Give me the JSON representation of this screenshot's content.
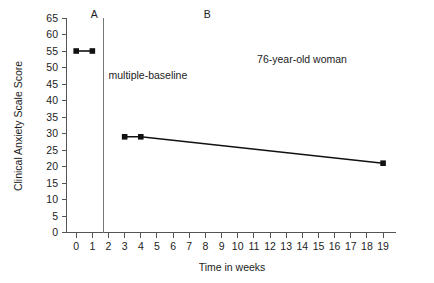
{
  "chart_data": {
    "type": "line",
    "title": "",
    "xlabel": "Time in weeks",
    "ylabel": "Clinical Anxiety Scale Score",
    "xlim": [
      -0.6,
      19.8
    ],
    "ylim": [
      0,
      65
    ],
    "grid": false,
    "legend": "none",
    "x_ticks": [
      0,
      1,
      2,
      3,
      4,
      5,
      6,
      7,
      8,
      9,
      10,
      11,
      12,
      13,
      14,
      15,
      16,
      17,
      18,
      19
    ],
    "x_tick_labels": [
      "0",
      "1",
      "2",
      "3",
      "4",
      "5",
      "6",
      "7",
      "8",
      "9",
      "10",
      "11",
      "12",
      "13",
      "14",
      "15",
      "16",
      "17",
      "18",
      "19"
    ],
    "y_ticks": [
      0,
      5,
      10,
      15,
      20,
      25,
      30,
      35,
      40,
      45,
      50,
      55,
      60,
      65
    ],
    "y_tick_labels": [
      "0",
      "5",
      "10",
      "15",
      "20",
      "25",
      "30",
      "35",
      "40",
      "45",
      "50",
      "55",
      "60",
      "65"
    ],
    "series": [
      {
        "name": "Phase A baseline",
        "x": [
          0,
          1
        ],
        "values": [
          55,
          55
        ],
        "marker": "square",
        "color": "#111111"
      },
      {
        "name": "Phase B treatment",
        "x": [
          3,
          4,
          19
        ],
        "values": [
          29,
          29,
          21
        ],
        "marker": "square",
        "color": "#111111"
      }
    ],
    "phase_change_line": {
      "x": 1.7,
      "color": "#777777"
    },
    "annotations": [
      {
        "name": "phase-a-label",
        "text": "A",
        "x": 0.9,
        "y": 66
      },
      {
        "name": "phase-b-label",
        "text": "B",
        "x": 7.9,
        "y": 66
      },
      {
        "name": "multiple-baseline-label",
        "text": "multiple-baseline",
        "x": 2.0,
        "y": 47.5
      },
      {
        "name": "subject-label",
        "text": "76-year-old woman",
        "x": 11.2,
        "y": 52.5
      }
    ]
  },
  "axis": {
    "y_title": "Clinical Anxiety Scale Score",
    "x_title": "Time in weeks"
  },
  "colors": {
    "data": "#111111",
    "axis": "#555555",
    "phase_line": "#777777",
    "background": "#ffffff",
    "text": "#1c1c1c"
  }
}
